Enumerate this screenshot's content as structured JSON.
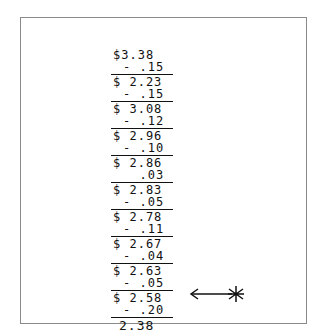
{
  "document": {
    "type": "handwritten-subtraction",
    "start": "$3.38",
    "steps": [
      {
        "subtract": "- .15",
        "result": "$ 2.23"
      },
      {
        "subtract": "- .15",
        "result": "$ 3.08"
      },
      {
        "subtract": "- .12",
        "result": "$ 2.96"
      },
      {
        "subtract": "- .10",
        "result": "$ 2.86"
      },
      {
        "subtract": "  .03",
        "result": "$ 2.83"
      },
      {
        "subtract": "- .05",
        "result": "$ 2.78"
      },
      {
        "subtract": "- .11",
        "result": "$ 2.67"
      },
      {
        "subtract": "- .04",
        "result": "$ 2.63"
      },
      {
        "subtract": "- .05",
        "result": "$ 2.58"
      },
      {
        "subtract": "- .20",
        "result": "2.38"
      }
    ],
    "annotation": "arrow-with-asterisk"
  }
}
